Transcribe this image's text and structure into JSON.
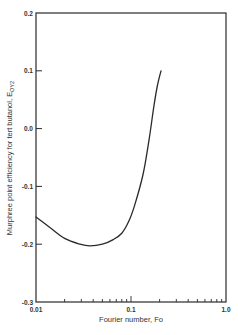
{
  "chart_data": {
    "type": "line",
    "title": "",
    "xlabel": "Fourier number, Fo",
    "ylabel": "Murphree point efficiency for tert butanol, E",
    "ylabel_subscript": "OY2",
    "x_scale": "log",
    "xlim": [
      0.01,
      1.0
    ],
    "ylim": [
      -0.3,
      0.2
    ],
    "grid": false,
    "legend": null,
    "x_ticks": [
      {
        "value": 0.01,
        "label": "0.01"
      },
      {
        "value": 0.1,
        "label": "0.1"
      },
      {
        "value": 1.0,
        "label": "1.0"
      }
    ],
    "y_ticks": [
      {
        "value": 0.2,
        "label": "0.2"
      },
      {
        "value": 0.1,
        "label": "0.1"
      },
      {
        "value": 0.0,
        "label": "0.0"
      },
      {
        "value": -0.1,
        "label": "-0.1"
      },
      {
        "value": -0.2,
        "label": "-0.2"
      },
      {
        "value": -0.3,
        "label": "-0.3"
      }
    ],
    "series": [
      {
        "name": "Murphree point efficiency",
        "color": "#2a2a2a",
        "x": [
          0.01,
          0.014,
          0.02,
          0.029,
          0.037,
          0.05,
          0.065,
          0.08,
          0.095,
          0.11,
          0.134,
          0.155,
          0.175,
          0.19,
          0.207
        ],
        "y": [
          -0.153,
          -0.171,
          -0.19,
          -0.2,
          -0.203,
          -0.2,
          -0.192,
          -0.181,
          -0.16,
          -0.131,
          -0.079,
          -0.019,
          0.041,
          0.075,
          0.1
        ]
      }
    ]
  },
  "axes": {
    "x_title": "Fourier number, Fo",
    "y_title_main": "Murphree point efficiency for tert butanol, E",
    "y_title_sub": "OY2"
  },
  "colors": {
    "axis": "#2a2a2a",
    "line": "#2a2a2a",
    "background": "#ffffff"
  }
}
